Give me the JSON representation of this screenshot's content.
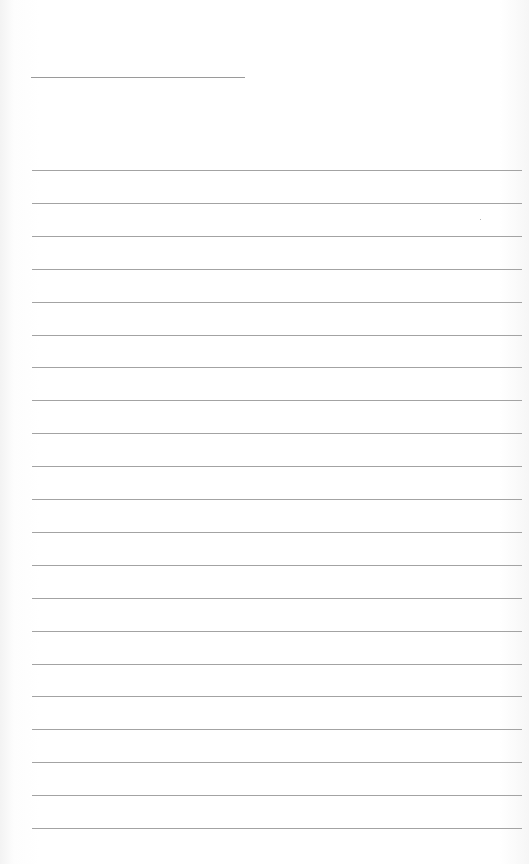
{
  "page": {
    "type": "lined-paper",
    "background": "#ffffff",
    "line_color": "#a3a3a3"
  },
  "title_line": {
    "x": 31,
    "y": 77,
    "width": 214
  },
  "ruled_lines": {
    "x": 32,
    "width": 490,
    "first_y": 170,
    "spacing": 32.9,
    "count": 21
  }
}
